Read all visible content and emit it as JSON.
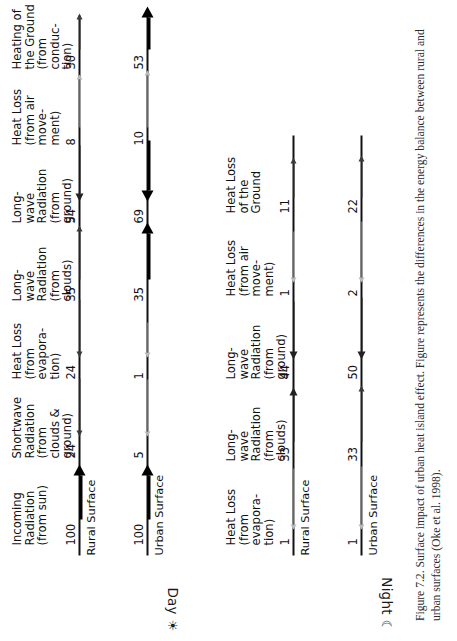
{
  "figure": {
    "caption": "Figure 7.2. Surface impact of urban heat island effect. Figure represents the differences in the energy balance between rural and urban surfaces (Oke et al. 1998)."
  },
  "periods": {
    "day": {
      "label": "Day",
      "glyph": "☀"
    },
    "night": {
      "label": "Night",
      "glyph": "☾"
    }
  },
  "surfaces": {
    "rural": "Rural Surface",
    "urban": "Urban Surface"
  },
  "day": {
    "fluxes": [
      {
        "caption": "Incoming\nRadiation\n(from sun)",
        "rural": "100",
        "urban": "100"
      },
      {
        "caption": "Shortwave\nRadiation\n(from\nclouds &\nground)",
        "rural": "24",
        "urban": "5"
      },
      {
        "caption": "Heat Loss\n(from\nevapora-\ntion)",
        "rural": "24",
        "urban": "1"
      },
      {
        "caption": "Long-\nwave\nRadiation\n(from\nclouds)",
        "rural": "35",
        "urban": "35"
      },
      {
        "caption": "Long-\nwave\nRadiation\n(from\nground)",
        "rural": "54",
        "urban": "69"
      },
      {
        "caption": "Heat Loss\n(from air\nmove-\nment)",
        "rural": "8",
        "urban": "10"
      },
      {
        "caption": "Heating of\nthe Ground\n(from\nconduc-\ntion)",
        "rural": "30",
        "urban": "53"
      }
    ]
  },
  "night": {
    "fluxes": [
      {
        "caption": "Heat Loss\n(from\nevapora-\ntion)",
        "rural": "1",
        "urban": "1"
      },
      {
        "caption": "Long-\nwave\nRadiation\n(from\nclouds)",
        "rural": "33",
        "urban": "33"
      },
      {
        "caption": "Long-\nwave\nRadiation\n(from\nground)",
        "rural": "44",
        "urban": "50"
      },
      {
        "caption": "Heat Loss\n(from air\nmove-\nment)",
        "rural": "1",
        "urban": "2"
      },
      {
        "caption": "Heat Loss\nof the\nGround",
        "rural": "11",
        "urban": "22"
      }
    ]
  },
  "colors": {
    "ink": "#111111",
    "faint": "#b9b9b9",
    "paper": "#ffffff"
  }
}
